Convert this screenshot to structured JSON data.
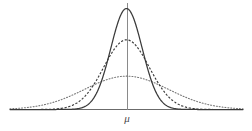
{
  "figure": {
    "title": "",
    "background_color": "#ffffff",
    "width": 252,
    "height": 131,
    "mean_label": "μ",
    "mean_label_name": "mu-axis-label"
  },
  "chart_data": {
    "type": "line",
    "title": "",
    "subtitle": "",
    "xlabel": "μ",
    "ylabel": "",
    "grid": false,
    "legend_position": "none",
    "annotations": [
      {
        "text": "μ",
        "x": 0,
        "y": 0,
        "description": "mean tick label centered under the vertical mean line"
      }
    ],
    "axes": {
      "x_axis_line": true,
      "y_axis_line": false,
      "mean_vertical_line": true,
      "xlim": [
        -4.6,
        4.6
      ],
      "ylim": [
        0,
        1.12
      ],
      "x_tick_labels": [
        "μ"
      ],
      "y_tick_labels": []
    },
    "x": [
      -4.6,
      -4.4,
      -4.2,
      -4.0,
      -3.8,
      -3.6,
      -3.4,
      -3.2,
      -3.0,
      -2.8,
      -2.6,
      -2.4,
      -2.2,
      -2.0,
      -1.8,
      -1.6,
      -1.4,
      -1.2,
      -1.0,
      -0.8,
      -0.6,
      -0.4,
      -0.2,
      0.0,
      0.2,
      0.4,
      0.6,
      0.8,
      1.0,
      1.2,
      1.4,
      1.6,
      1.8,
      2.0,
      2.2,
      2.4,
      2.6,
      2.8,
      3.0,
      3.2,
      3.4,
      3.6,
      3.8,
      4.0,
      4.2,
      4.4,
      4.6
    ],
    "series": [
      {
        "name": "small variance",
        "line_style": "solid",
        "color": "#3a3a3a",
        "sigma": 0.62,
        "peak_value": 1.0,
        "values": [
          0.0,
          0.0,
          0.0,
          0.0,
          0.0,
          0.0,
          0.0,
          0.0,
          0.0,
          0.0,
          0.0,
          0.001,
          0.002,
          0.006,
          0.016,
          0.036,
          0.077,
          0.153,
          0.277,
          0.44,
          0.632,
          0.818,
          0.949,
          1.0,
          0.949,
          0.818,
          0.632,
          0.44,
          0.277,
          0.153,
          0.077,
          0.036,
          0.016,
          0.006,
          0.002,
          0.001,
          0.0,
          0.0,
          0.0,
          0.0,
          0.0,
          0.0,
          0.0,
          0.0,
          0.0,
          0.0,
          0.0
        ]
      },
      {
        "name": "medium variance",
        "line_style": "dashed",
        "color": "#3a3a3a",
        "sigma": 0.9,
        "peak_value": 0.69,
        "values": [
          0.0,
          0.0,
          0.0,
          0.0,
          0.0,
          0.001,
          0.002,
          0.005,
          0.01,
          0.021,
          0.04,
          0.07,
          0.115,
          0.175,
          0.249,
          0.331,
          0.414,
          0.488,
          0.545,
          0.59,
          0.636,
          0.669,
          0.686,
          0.69,
          0.686,
          0.669,
          0.636,
          0.59,
          0.545,
          0.488,
          0.414,
          0.331,
          0.249,
          0.175,
          0.115,
          0.07,
          0.04,
          0.021,
          0.01,
          0.005,
          0.002,
          0.001,
          0.0,
          0.0,
          0.0,
          0.0,
          0.0
        ]
      },
      {
        "name": "large variance",
        "line_style": "dotted",
        "color": "#777777",
        "sigma": 1.65,
        "peak_value": 0.33,
        "values": [
          0.007,
          0.01,
          0.013,
          0.018,
          0.024,
          0.031,
          0.04,
          0.051,
          0.064,
          0.08,
          0.098,
          0.118,
          0.14,
          0.163,
          0.187,
          0.21,
          0.232,
          0.252,
          0.27,
          0.287,
          0.303,
          0.316,
          0.326,
          0.33,
          0.326,
          0.316,
          0.303,
          0.287,
          0.27,
          0.252,
          0.232,
          0.21,
          0.187,
          0.163,
          0.14,
          0.118,
          0.098,
          0.08,
          0.064,
          0.051,
          0.04,
          0.031,
          0.024,
          0.018,
          0.013,
          0.01,
          0.007
        ]
      }
    ]
  },
  "colors": {
    "solid_curve": "#3a3a3a",
    "dashed_curve": "#3a3a3a",
    "dotted_curve": "#808080",
    "axis_line": "#6b6b6b",
    "mean_line": "#8a8a8a",
    "label_text": "#4a4a4a",
    "background": "#ffffff"
  }
}
